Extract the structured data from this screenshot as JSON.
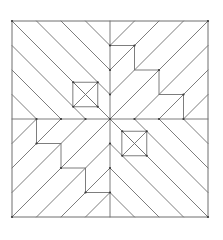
{
  "figure": {
    "stroke_color": "#6e6e6e",
    "background": "#ffffff",
    "origin": [
      12,
      21
    ],
    "unit": 24.5,
    "grid_size": 8,
    "frame": [
      [
        0,
        0
      ],
      [
        8,
        0
      ],
      [
        8,
        8
      ],
      [
        0,
        8
      ]
    ],
    "midlines": [
      [
        [
          4,
          0
        ],
        [
          4,
          8
        ]
      ],
      [
        [
          0,
          4
        ],
        [
          8,
          4
        ]
      ]
    ],
    "small_squares": [
      {
        "name": "top-left-square",
        "corners": [
          [
            2.5,
            2.5
          ],
          [
            3.5,
            2.5
          ],
          [
            3.5,
            3.5
          ],
          [
            2.5,
            3.5
          ]
        ]
      },
      {
        "name": "bottom-right-square",
        "corners": [
          [
            4.5,
            4.5
          ],
          [
            5.5,
            4.5
          ],
          [
            5.5,
            5.5
          ],
          [
            4.5,
            5.5
          ]
        ]
      }
    ],
    "stairs": [
      {
        "name": "top-right-stair",
        "points": [
          [
            4,
            1
          ],
          [
            5,
            1
          ],
          [
            5,
            2
          ],
          [
            6,
            2
          ],
          [
            6,
            3
          ],
          [
            7,
            3
          ],
          [
            7,
            4
          ]
        ]
      },
      {
        "name": "bottom-left-stair",
        "points": [
          [
            1,
            4
          ],
          [
            1,
            5
          ],
          [
            2,
            5
          ],
          [
            2,
            6
          ],
          [
            3,
            6
          ],
          [
            3,
            7
          ],
          [
            4,
            7
          ]
        ]
      }
    ],
    "segments": [
      [
        [
          0,
          0
        ],
        [
          4,
          4
        ]
      ],
      [
        [
          1,
          0
        ],
        [
          4,
          3
        ]
      ],
      [
        [
          2,
          0
        ],
        [
          4,
          2
        ]
      ],
      [
        [
          3,
          0
        ],
        [
          4,
          1
        ]
      ],
      [
        [
          0,
          1
        ],
        [
          3,
          4
        ]
      ],
      [
        [
          0,
          2
        ],
        [
          2,
          4
        ]
      ],
      [
        [
          0,
          3
        ],
        [
          1,
          4
        ]
      ],
      [
        [
          4,
          4
        ],
        [
          8,
          8
        ]
      ],
      [
        [
          7,
          8
        ],
        [
          4,
          5
        ]
      ],
      [
        [
          6,
          8
        ],
        [
          4,
          6
        ]
      ],
      [
        [
          5,
          8
        ],
        [
          4,
          7
        ]
      ],
      [
        [
          8,
          7
        ],
        [
          5,
          4
        ]
      ],
      [
        [
          8,
          6
        ],
        [
          6,
          4
        ]
      ],
      [
        [
          8,
          5
        ],
        [
          7,
          4
        ]
      ],
      [
        [
          4,
          1
        ],
        [
          5,
          0
        ]
      ],
      [
        [
          5,
          1
        ],
        [
          6,
          0
        ]
      ],
      [
        [
          5,
          2
        ],
        [
          7,
          0
        ]
      ],
      [
        [
          6,
          2
        ],
        [
          8,
          0
        ]
      ],
      [
        [
          6,
          3
        ],
        [
          8,
          1
        ]
      ],
      [
        [
          7,
          3
        ],
        [
          8,
          2
        ]
      ],
      [
        [
          7,
          4
        ],
        [
          8,
          3
        ]
      ],
      [
        [
          5,
          1
        ],
        [
          4,
          2
        ]
      ],
      [
        [
          5,
          2
        ],
        [
          4,
          3
        ]
      ],
      [
        [
          6,
          2
        ],
        [
          4,
          4
        ]
      ],
      [
        [
          6,
          3
        ],
        [
          5,
          4
        ]
      ],
      [
        [
          7,
          3
        ],
        [
          6,
          4
        ]
      ],
      [
        [
          0,
          5
        ],
        [
          1,
          4
        ]
      ],
      [
        [
          0,
          6
        ],
        [
          1,
          5
        ]
      ],
      [
        [
          0,
          7
        ],
        [
          2,
          5
        ]
      ],
      [
        [
          0,
          8
        ],
        [
          2,
          6
        ]
      ],
      [
        [
          1,
          8
        ],
        [
          3,
          6
        ]
      ],
      [
        [
          2,
          8
        ],
        [
          3,
          7
        ]
      ],
      [
        [
          3,
          8
        ],
        [
          4,
          7
        ]
      ],
      [
        [
          1,
          5
        ],
        [
          2,
          4
        ]
      ],
      [
        [
          2,
          5
        ],
        [
          3,
          4
        ]
      ],
      [
        [
          2,
          6
        ],
        [
          4,
          4
        ]
      ],
      [
        [
          3,
          6
        ],
        [
          4,
          5
        ]
      ],
      [
        [
          3,
          7
        ],
        [
          4,
          6
        ]
      ]
    ],
    "vertices": [
      [
        0,
        0
      ],
      [
        2.5,
        2.5
      ],
      [
        3.5,
        2.5
      ],
      [
        2.5,
        3.5
      ],
      [
        3.5,
        3.5
      ],
      [
        4,
        4
      ],
      [
        4,
        1
      ],
      [
        4,
        2
      ],
      [
        4,
        3
      ],
      [
        5,
        1
      ],
      [
        6,
        2
      ],
      [
        7,
        3
      ],
      [
        8,
        0
      ],
      [
        4.5,
        4.5
      ],
      [
        5.5,
        4.5
      ],
      [
        4.5,
        5.5
      ],
      [
        5.5,
        5.5
      ],
      [
        4,
        5
      ],
      [
        4,
        6
      ],
      [
        4,
        7
      ],
      [
        5,
        4
      ],
      [
        6,
        4
      ],
      [
        7,
        4
      ],
      [
        1,
        4
      ],
      [
        2,
        4
      ],
      [
        3,
        4
      ],
      [
        0,
        8
      ],
      [
        8,
        8
      ],
      [
        2,
        6
      ],
      [
        3,
        7
      ],
      [
        1,
        5
      ]
    ]
  }
}
